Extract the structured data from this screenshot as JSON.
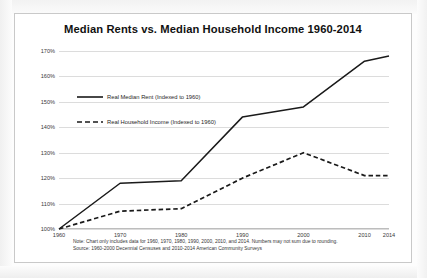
{
  "chart_data": {
    "type": "line",
    "title": "Median Rents vs. Median Household Income 1960-2014",
    "xlabel": "",
    "ylabel": "",
    "x": [
      1960,
      1970,
      1980,
      1990,
      2000,
      2010,
      2014
    ],
    "categories": [
      "1960",
      "1970",
      "1980",
      "1990",
      "2000",
      "2010",
      "2014"
    ],
    "series": [
      {
        "name": "Real Median Rent (Indexed to 1960)",
        "style": "solid",
        "color": "#1a1a1a",
        "values": [
          100,
          118,
          119,
          144,
          148,
          166,
          168
        ]
      },
      {
        "name": "Real Household Income (Indexed to 1960)",
        "style": "dashed",
        "color": "#1a1a1a",
        "values": [
          100,
          107,
          108,
          120,
          130,
          121,
          121
        ]
      }
    ],
    "ylim": [
      100,
      170
    ],
    "ytick_values": [
      100,
      110,
      120,
      130,
      140,
      150,
      160,
      170
    ],
    "ytick_labels": [
      "100%",
      "110%",
      "120%",
      "130%",
      "140%",
      "150%",
      "160%",
      "170%"
    ],
    "xlim": [
      1960,
      2014
    ],
    "grid": "horizontal",
    "legend_position": "upper-left-inside",
    "notes": [
      "Note: Chart only includes data for 1960, 1970, 1980, 1990, 2000, 2010, and 2014. Numbers may not sum due to rounding.",
      "Source: 1960-2000 Decennial Censuses and 2010-2014 American Community Surveys"
    ]
  },
  "legend": {
    "items": [
      {
        "label": "Real Median Rent (Indexed to 1960)"
      },
      {
        "label": "Real Household Income (Indexed to 1960)"
      }
    ]
  },
  "footnotes": {
    "note": "Note: Chart only includes data for 1960, 1970, 1980, 1990, 2000, 2010, and 2014. Numbers may not sum due to rounding.",
    "source": "Source: 1960-2000 Decennial Censuses and 2010-2014 American Community Surveys"
  }
}
